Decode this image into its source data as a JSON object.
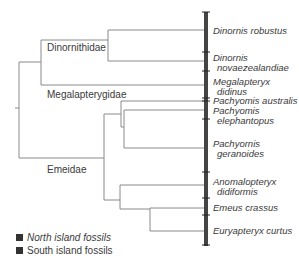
{
  "diagram": {
    "type": "cladogram",
    "clades": [
      {
        "name": "Dinornithidae"
      },
      {
        "name": "Megalapterygidae"
      },
      {
        "name": "Emeidae"
      }
    ],
    "species": [
      {
        "line1": "Dinornis robustus",
        "line2": ""
      },
      {
        "line1": "Dinornis",
        "line2": "novaezealandiae"
      },
      {
        "line1": "Megalapteryx",
        "line2": "didinus"
      },
      {
        "line1": "Pachyomis australis",
        "line2": ""
      },
      {
        "line1": "Pachyomis",
        "line2": "elephantopus"
      },
      {
        "line1": "Pachyornis",
        "line2": "geranoides"
      },
      {
        "line1": "Anomalopteryx",
        "line2": "didiformis"
      },
      {
        "line1": "Emeus crassus",
        "line2": ""
      },
      {
        "line1": "Euryapteryx curtus",
        "line2": ""
      }
    ],
    "legend": [
      {
        "label": "North island fossils",
        "style": "italic"
      },
      {
        "label": "South island fossils",
        "style": "normal"
      }
    ],
    "colors": {
      "branch": "#8a8a8a",
      "bar": "#444444",
      "swatch": "#333333"
    }
  }
}
